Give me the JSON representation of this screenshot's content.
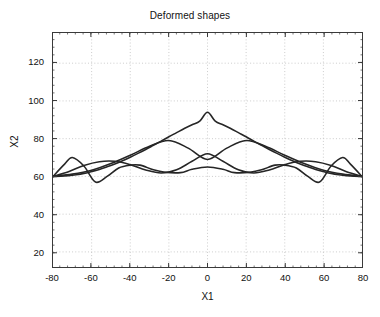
{
  "chart": {
    "title": "Deformed shapes",
    "xlabel": "X1",
    "ylabel": "X2"
  },
  "chart_data": {
    "type": "line",
    "title": "Deformed shapes",
    "xlabel": "X1",
    "ylabel": "X2",
    "xlim": [
      -80,
      80
    ],
    "ylim": [
      12,
      136
    ],
    "xticks": [
      -80,
      -60,
      -40,
      -20,
      0,
      20,
      40,
      60,
      80
    ],
    "xtick_labels": [
      "-80",
      "-60",
      "-40",
      "-20",
      "0",
      "20",
      "40",
      "60",
      "80"
    ],
    "yticks": [
      20,
      40,
      60,
      80,
      100,
      120
    ],
    "ytick_labels": [
      "20",
      "40",
      "60",
      "80",
      "100",
      "120"
    ],
    "grid": true,
    "grid_style": "dotted",
    "grid_color": "#bfbfbf",
    "legend": null,
    "line_color": "#262626",
    "line_width": 1.6,
    "baseline": 60,
    "series": [
      {
        "name": "mode-1",
        "n_half_waves": 1,
        "amplitude": 34,
        "peak": {
          "x": 0,
          "y": 94
        },
        "x": [
          -80,
          -76,
          -72,
          -68,
          -64,
          -60,
          -56,
          -52,
          -48,
          -44,
          -40,
          -36,
          -32,
          -28,
          -24,
          -20,
          -16,
          -12,
          -8,
          -4,
          0,
          4,
          8,
          12,
          16,
          20,
          24,
          28,
          32,
          36,
          40,
          44,
          48,
          52,
          56,
          60,
          64,
          68,
          72,
          76,
          80
        ],
        "y": [
          60.0,
          60.1,
          60.4,
          60.9,
          61.6,
          62.6,
          63.7,
          65.1,
          66.6,
          68.3,
          70.2,
          72.2,
          74.3,
          76.5,
          78.7,
          81.0,
          83.2,
          85.4,
          87.4,
          89.3,
          94.0,
          89.3,
          87.4,
          85.4,
          83.2,
          81.0,
          78.7,
          76.5,
          74.3,
          72.2,
          70.2,
          68.3,
          66.6,
          65.1,
          63.7,
          62.6,
          61.6,
          60.9,
          60.4,
          60.1,
          60.0
        ]
      },
      {
        "name": "mode-2",
        "n_half_waves": 2,
        "amplitude": 20,
        "peaks": [
          {
            "x": -21,
            "y": 79
          },
          {
            "x": 21,
            "y": 79
          }
        ],
        "center_dip": {
          "x": 0,
          "y": 69
        },
        "x": [
          -80,
          -70,
          -60,
          -50,
          -40,
          -30,
          -20,
          -10,
          0,
          10,
          20,
          30,
          40,
          50,
          60,
          70,
          80
        ],
        "y": [
          60.0,
          61.2,
          63.3,
          66.8,
          71.2,
          76.0,
          79.0,
          75.0,
          69.0,
          75.0,
          79.0,
          76.0,
          71.2,
          66.8,
          63.3,
          61.2,
          60.0
        ]
      },
      {
        "name": "mode-3",
        "n_half_waves": 3,
        "amplitude": 13,
        "peaks": [
          {
            "x": -45,
            "y": 68
          },
          {
            "x": 0,
            "y": 72
          },
          {
            "x": 45,
            "y": 68
          }
        ],
        "dips": [
          {
            "x": -27,
            "y": 62
          },
          {
            "x": 27,
            "y": 62
          }
        ],
        "x": [
          -80,
          -72,
          -64,
          -56,
          -48,
          -40,
          -32,
          -24,
          -16,
          -8,
          0,
          8,
          16,
          24,
          32,
          40,
          48,
          56,
          64,
          72,
          80
        ],
        "y": [
          60.0,
          62.5,
          65.8,
          67.8,
          68.0,
          66.2,
          63.4,
          61.8,
          63.5,
          68.0,
          72.0,
          68.0,
          63.5,
          61.8,
          63.4,
          66.2,
          68.0,
          67.8,
          65.8,
          62.5,
          60.0
        ]
      },
      {
        "name": "mode-4",
        "n_half_waves": 5,
        "amplitude": 12,
        "peaks": [
          {
            "x": -70,
            "y": 70
          },
          {
            "x": -35,
            "y": 66
          },
          {
            "x": 0,
            "y": 65
          },
          {
            "x": 35,
            "y": 66
          },
          {
            "x": 70,
            "y": 70
          }
        ],
        "dips": [
          {
            "x": -58,
            "y": 57
          },
          {
            "x": -14,
            "y": 62
          },
          {
            "x": 14,
            "y": 62
          },
          {
            "x": 58,
            "y": 57
          }
        ],
        "x": [
          -80,
          -74,
          -70,
          -64,
          -58,
          -52,
          -46,
          -40,
          -35,
          -28,
          -22,
          -14,
          -8,
          0,
          8,
          14,
          22,
          28,
          35,
          40,
          46,
          52,
          58,
          64,
          70,
          74,
          80
        ],
        "y": [
          60.0,
          66.5,
          70.0,
          65.5,
          57.0,
          60.0,
          64.5,
          66.0,
          66.0,
          63.5,
          62.2,
          62.0,
          63.8,
          65.0,
          63.8,
          62.0,
          62.2,
          63.5,
          66.0,
          66.0,
          64.5,
          60.0,
          57.0,
          65.5,
          70.0,
          66.5,
          60.0
        ]
      }
    ]
  }
}
